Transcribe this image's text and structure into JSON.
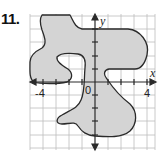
{
  "problem": {
    "number": "11."
  },
  "graph": {
    "x_axis_label": "x",
    "y_axis_label": "y",
    "origin_label": "0",
    "tick_labels": {
      "x_neg": "-4",
      "x_pos": "4"
    },
    "x_range": [
      -5,
      4.6
    ],
    "y_range": [
      -5.1,
      5.1
    ],
    "grid_unit": 1,
    "colors": {
      "shape_fill": "#d4d4d4",
      "shape_stroke": "#2a2a2a",
      "grid": "#bdbdbd",
      "axis": "#2a2a2a"
    }
  }
}
